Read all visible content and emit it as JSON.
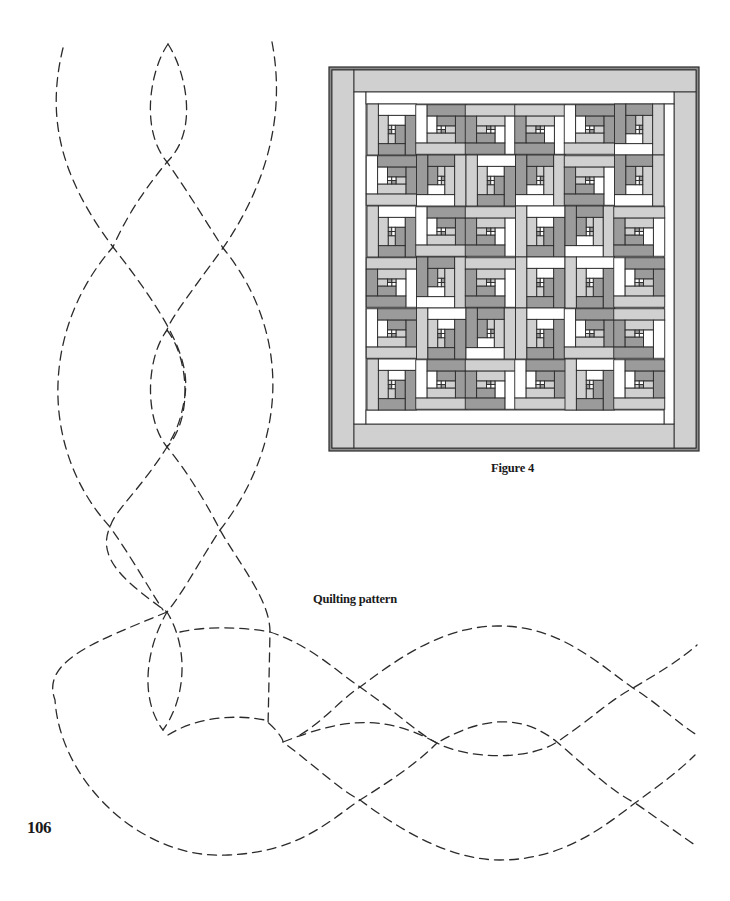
{
  "page": {
    "page_number": "106",
    "background": "#ffffff"
  },
  "figure": {
    "caption": "Figure 4",
    "colors": {
      "light": "#d0d0d0",
      "dark": "#9b9b9b",
      "white": "#ffffff",
      "line": "#2a2a2a",
      "frame": "#8c8c8c"
    },
    "grid": {
      "rows": 6,
      "cols": 6
    },
    "block_rotations": [
      [
        0,
        3,
        1,
        1,
        3,
        2
      ],
      [
        3,
        2,
        0,
        2,
        1,
        2
      ],
      [
        0,
        3,
        1,
        0,
        2,
        1
      ],
      [
        1,
        2,
        1,
        0,
        0,
        3
      ],
      [
        3,
        0,
        2,
        0,
        3,
        1
      ],
      [
        0,
        3,
        1,
        3,
        0,
        3
      ]
    ]
  },
  "quilting_pattern": {
    "caption": "Quilting pattern",
    "vertical_cable_paths": [
      "M63,48 C48,110 55,170 113,247 C170,320 190,360 185,395 C180,430 170,440 167,447 C140,490 115,510 110,527 C95,560 130,585 167,612 C190,650 185,700 163,730",
      "M168,44 C150,70 140,130 167,162 C190,195 205,220 223,248 C290,330 290,440 220,530 C200,560 185,590 167,612 C145,650 140,700 163,730",
      "M168,44 C185,70 200,130 167,162 C140,195 125,220 113,247 C40,330 40,450 110,527 C130,555 150,590 163,610",
      "M272,42 C285,110 270,180 223,248 C185,300 170,320 167,330 C145,360 145,420 167,447 C190,475 210,510 220,530 C240,565 270,600 270,632 L268,727",
      "M167,330 C190,360 192,420 167,447",
      "M167,612 C100,640 40,660 55,700 C60,780 140,860 228,855 C300,852 330,820 360,800 C400,775 420,760 437,743"
    ],
    "horizontal_cable_paths": [
      "M180,632 C210,625 250,628 270,632 C310,645 335,670 360,687 C400,715 420,735 437,743 C470,760 530,760 557,742 C590,720 610,700 633,688 C660,672 680,660 697,645",
      "M168,735 C200,715 240,715 265,720 C275,728 283,738 283,742 C320,770 340,790 360,800 C400,830 450,860 500,860 C560,860 600,830 635,803 C660,785 680,770 695,755",
      "M300,735 C325,720 340,700 360,687 C390,665 440,625 500,626 C560,626 600,665 633,688 C660,705 680,725 697,735",
      "M283,742 C340,720 380,712 437,743 C480,718 520,712 557,742 C590,770 610,790 635,803 C660,820 680,835 695,845"
    ]
  }
}
